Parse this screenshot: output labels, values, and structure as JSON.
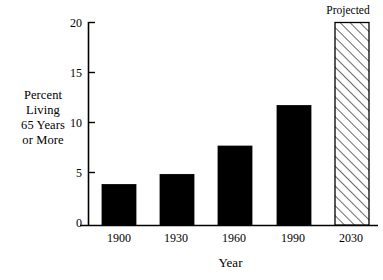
{
  "chart_data": {
    "type": "bar",
    "title": "",
    "xlabel": "Year",
    "ylabel": "Percent Living 65 Years or More",
    "ylabel_lines": [
      "Percent",
      "Living",
      "65 Years",
      "or More"
    ],
    "categories": [
      "1900",
      "1930",
      "1960",
      "1990",
      "2030"
    ],
    "values": [
      4.0,
      5.0,
      7.8,
      11.8,
      20.0
    ],
    "series": [
      {
        "name": "Percent Living 65 Years or More",
        "values": [
          4.0,
          5.0,
          7.8,
          11.8,
          20.0
        ]
      }
    ],
    "ylim": [
      0,
      20
    ],
    "yticks": [
      0,
      5,
      10,
      15,
      20
    ],
    "ytick_labels": [
      "0",
      "5",
      "10",
      "15",
      "20"
    ],
    "xlim_categories": 5,
    "grid": false,
    "legend": null,
    "annotations": [
      {
        "text": "Projected",
        "attached_to_category": "2030",
        "position": "above-bar"
      }
    ],
    "bar_styles": [
      {
        "category": "1900",
        "fill": "solid-black",
        "color": "#000000"
      },
      {
        "category": "1930",
        "fill": "solid-black",
        "color": "#000000"
      },
      {
        "category": "1960",
        "fill": "solid-black",
        "color": "#000000"
      },
      {
        "category": "1990",
        "fill": "solid-black",
        "color": "#000000"
      },
      {
        "category": "2030",
        "fill": "diagonal-hatch",
        "color": "#000000"
      }
    ],
    "colors": {
      "bar_solid": "#000000",
      "bar_hatch_line": "#000000",
      "bar_hatch_background": "#ffffff",
      "axis": "#000000",
      "text": "#000000",
      "background": "#ffffff"
    }
  },
  "axis": {
    "y_title_lines": {
      "line1": "Percent",
      "line2": "Living",
      "line3": "65 Years",
      "line4": "or More"
    },
    "x_title": "Year",
    "y_labels": {
      "t0": "0",
      "t5": "5",
      "t10": "10",
      "t15": "15",
      "t20": "20"
    },
    "x_labels": {
      "c0": "1900",
      "c1": "1930",
      "c2": "1960",
      "c3": "1990",
      "c4": "2030"
    }
  },
  "annotation": {
    "projected": "Projected"
  }
}
